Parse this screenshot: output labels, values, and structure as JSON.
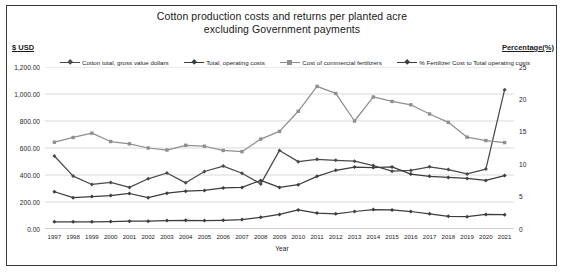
{
  "chart_data": {
    "type": "line",
    "title": "Cotton production costs and returns per planted acre",
    "subtitle": "excluding Government payments",
    "xlabel": "Year",
    "ylabel": "$ USD",
    "y2label": "Percentage(%)",
    "grid": true,
    "legend_position": "top",
    "ylim": [
      0,
      1200
    ],
    "y2lim": [
      0,
      25
    ],
    "ytick_labels": [
      "1,200.00",
      "1,000.00",
      "800.00",
      "600.00",
      "400.00",
      "200.00",
      "0.00"
    ],
    "ytick_values": [
      1200,
      1000,
      800,
      600,
      400,
      200,
      0
    ],
    "y2tick_labels": [
      "25",
      "20",
      "15",
      "10",
      "5",
      "0"
    ],
    "y2tick_values": [
      25,
      20,
      15,
      10,
      5,
      0
    ],
    "categories": [
      "1997",
      "1998",
      "1999",
      "2000",
      "2001",
      "2002",
      "2003",
      "2004",
      "2005",
      "2006",
      "2007",
      "2008",
      "2009",
      "2010",
      "2011",
      "2012",
      "2013",
      "2014",
      "2015",
      "2016",
      "2017",
      "2018",
      "2019",
      "2020",
      "2021"
    ],
    "series": [
      {
        "name": "Cotton total, gross value dollars",
        "axis": "left",
        "color": "#4a4a4a",
        "marker": "diamond",
        "values": [
          541,
          392,
          330,
          345,
          308,
          372,
          415,
          342,
          426,
          466,
          413,
          334,
          582,
          499,
          516,
          509,
          502,
          470,
          428,
          434,
          461,
          440,
          408,
          444,
          1032
        ]
      },
      {
        "name": "Total, operating costs",
        "axis": "left",
        "color": "#3d3d3d",
        "marker": "diamond",
        "values": [
          276,
          232,
          240,
          248,
          263,
          232,
          265,
          280,
          286,
          304,
          308,
          360,
          308,
          328,
          390,
          435,
          459,
          455,
          460,
          407,
          390,
          382,
          375,
          360,
          396
        ]
      },
      {
        "name": "Cost of commercial fertilizers",
        "axis": "left",
        "color": "#8f8f8f",
        "marker": "square",
        "values": [
          643,
          678,
          710,
          648,
          631,
          600,
          585,
          620,
          613,
          582,
          573,
          666,
          723,
          872,
          1056,
          1004,
          800,
          978,
          945,
          920,
          852,
          790,
          680,
          655,
          640
        ]
      },
      {
        "name": "% Fertilizer Cost to Total operating costs",
        "axis": "right",
        "color": "#3d3d3d",
        "marker": "diamond",
        "values": [
          1.1,
          1.1,
          1.1,
          1.15,
          1.2,
          1.2,
          1.3,
          1.35,
          1.3,
          1.35,
          1.45,
          1.8,
          2.25,
          2.95,
          2.45,
          2.35,
          2.7,
          3.0,
          2.95,
          2.7,
          2.35,
          1.95,
          1.9,
          2.25,
          2.2
        ]
      }
    ]
  },
  "chart": {
    "title_line1": "Cotton production costs and returns per planted acre",
    "title_line2": "excluding Government payments",
    "left_axis_title": "$ USD",
    "right_axis_title": "Percentage(%)",
    "x_axis_title": "Year"
  }
}
